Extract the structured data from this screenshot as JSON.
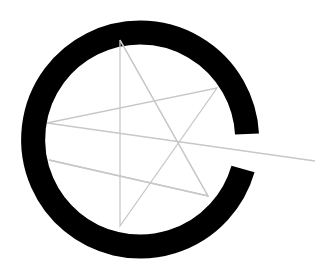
{
  "logo": {
    "description": "Open black ring with gap on right and light gray star-like line figure",
    "colors": {
      "ring": "#000000",
      "lines": "#c8c8c8",
      "background": "#ffffff"
    },
    "ring": {
      "cx": 140,
      "cy": 132,
      "r": 107,
      "stroke_width": 24
    },
    "star_points": [
      {
        "x": 120,
        "y": 40
      },
      {
        "x": 208,
        "y": 196
      },
      {
        "x": 49,
        "y": 160
      },
      {
        "x": 120,
        "y": 226
      },
      {
        "x": 217,
        "y": 88
      },
      {
        "x": 47,
        "y": 123
      },
      {
        "x": 315,
        "y": 161
      }
    ]
  }
}
